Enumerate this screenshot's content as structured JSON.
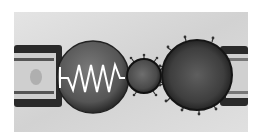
{
  "image": {
    "description": "Grayscale micrograph-style illustration: two micropipettes holding cells; left cell contains a white zigzag spring symbol connected to a small spiky particle, which approaches a larger spiky cell held by the right pipette.",
    "background_color": "#dcdcdc",
    "frame": {
      "x": 14,
      "y": 12,
      "width": 234,
      "height": 120
    }
  },
  "objects": [
    {
      "name": "left-pipette",
      "x": 14,
      "y": 45,
      "width": 48,
      "height": 62,
      "color": "#222222"
    },
    {
      "name": "left-cell",
      "cx": 93,
      "cy": 77,
      "r": 35,
      "color": "#555555"
    },
    {
      "name": "spring",
      "color": "#ffffff",
      "zigzag_count": 6
    },
    {
      "name": "small-spiky-particle",
      "cx": 144,
      "cy": 76,
      "r": 17,
      "color": "#4a4a4a",
      "spikes": 10
    },
    {
      "name": "large-spiky-cell",
      "cx": 197,
      "cy": 75,
      "r": 35,
      "color": "#3a3a3a",
      "spikes": 12
    },
    {
      "name": "right-pipette",
      "x": 220,
      "y": 46,
      "width": 28,
      "height": 60,
      "color": "#222222"
    }
  ]
}
